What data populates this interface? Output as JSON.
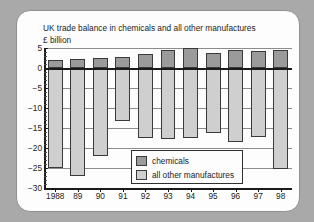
{
  "chart_data": {
    "type": "bar",
    "title": "UK trade balance in chemicals and all other manufactures",
    "subtitle": "£ billion",
    "xlabel": "",
    "ylabel": "£ billion",
    "ylim": [
      -30,
      5
    ],
    "yticks": [
      5,
      0,
      -5,
      -10,
      -15,
      -20,
      -25,
      -30
    ],
    "ytick_labels": [
      "5",
      "0",
      "−5",
      "−10",
      "−15",
      "−20",
      "−25",
      "−30"
    ],
    "grid": true,
    "legend_position": "bottom-center",
    "stacked": false,
    "categories": [
      "1988",
      "89",
      "90",
      "91",
      "92",
      "93",
      "94",
      "95",
      "96",
      "97",
      "98"
    ],
    "series": [
      {
        "name": "chemicals",
        "color": "#9b9b9b",
        "values": [
          2.0,
          2.2,
          2.5,
          2.8,
          3.5,
          4.6,
          5.0,
          3.8,
          4.4,
          4.3,
          4.6
        ]
      },
      {
        "name": "all other manufactures",
        "color": "#cfcfcf",
        "values": [
          -25.0,
          -27.0,
          -22.0,
          -13.2,
          -17.6,
          -17.8,
          -17.6,
          -16.2,
          -18.6,
          -17.3,
          -25.3
        ]
      }
    ]
  },
  "legend": {
    "items": [
      {
        "label": "chemicals",
        "color": "#9b9b9b"
      },
      {
        "label": "all other manufactures",
        "color": "#cfcfcf"
      }
    ]
  }
}
